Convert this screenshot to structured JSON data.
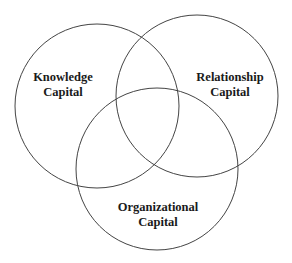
{
  "diagram": {
    "type": "venn",
    "stroke_color": "#444444",
    "circles": [
      {
        "id": "knowledge",
        "line1": "Knowledge",
        "line2": "Capital",
        "cx": 97,
        "cy": 106,
        "r": 82
      },
      {
        "id": "relationship",
        "line1": "Relationship",
        "line2": "Capital",
        "cx": 197,
        "cy": 96,
        "r": 81
      },
      {
        "id": "organizational",
        "line1": "Organizational",
        "line2": "Capital",
        "cx": 157,
        "cy": 169,
        "r": 81
      }
    ]
  }
}
